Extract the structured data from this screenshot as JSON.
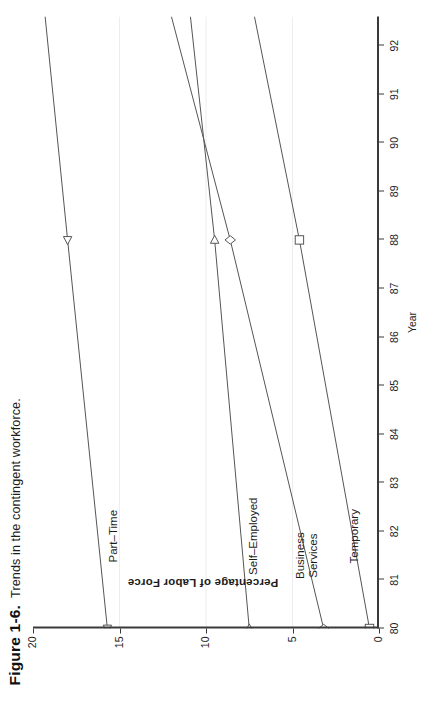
{
  "caption": {
    "figure_number": "Figure 1-6.",
    "text": "Trends in the contingent workforce."
  },
  "chart_data": {
    "type": "line",
    "title": "Trends in the contingent workforce.",
    "xlabel": "Year",
    "ylabel": "Percentage of Labor Force",
    "xlim": [
      80,
      92.6
    ],
    "ylim": [
      0,
      20
    ],
    "xticks": [
      "80",
      "81",
      "82",
      "83",
      "84",
      "85",
      "86",
      "87",
      "88",
      "89",
      "90",
      "91",
      "92"
    ],
    "yticks": [
      "0",
      "5",
      "10",
      "15",
      "20"
    ],
    "grid": "horizontal-faint",
    "legend": "inline-labels",
    "x": [
      80,
      88,
      92.6
    ],
    "series": [
      {
        "name": "Part-Time",
        "label": "Part–Time",
        "marker": "triangle-left",
        "color": "#555555",
        "values": [
          15.7,
          18.0,
          19.3
        ]
      },
      {
        "name": "Self-Employed",
        "label": "Self–Employed",
        "marker": "triangle-right",
        "color": "#555555",
        "values": [
          7.5,
          9.5,
          10.9
        ]
      },
      {
        "name": "Business Services",
        "label": "Business\nServices",
        "marker": "diamond",
        "color": "#555555",
        "values": [
          3.2,
          8.6,
          12.0
        ]
      },
      {
        "name": "Temporary",
        "label": "Temporary",
        "marker": "square",
        "color": "#555555",
        "values": [
          0.55,
          4.6,
          7.2
        ]
      }
    ]
  }
}
